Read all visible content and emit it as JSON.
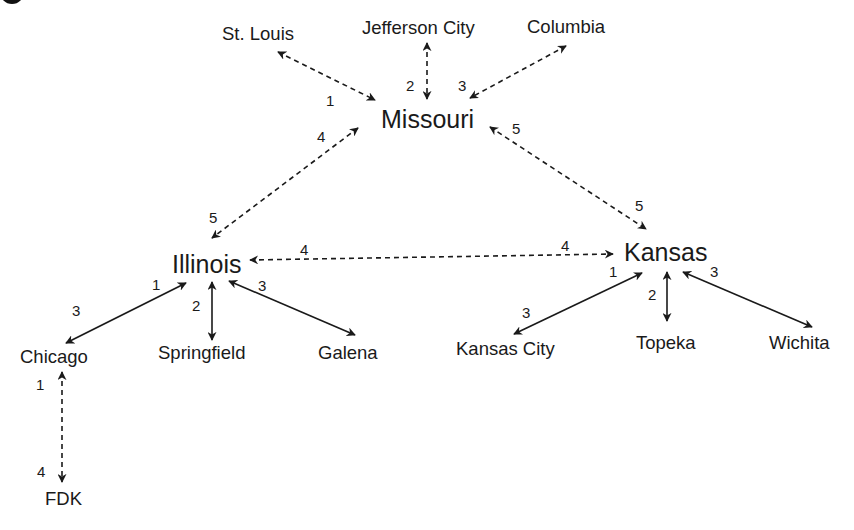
{
  "diagram": {
    "type": "hierarchical-network",
    "states": {
      "missouri": "Missouri",
      "illinois": "Illinois",
      "kansas": "Kansas"
    },
    "cities": {
      "st_louis": "St. Louis",
      "jefferson_city": "Jefferson City",
      "columbia": "Columbia",
      "chicago": "Chicago",
      "springfield": "Springfield",
      "galena": "Galena",
      "kansas_city": "Kansas City",
      "topeka": "Topeka",
      "wichita": "Wichita",
      "fdk": "FDK"
    },
    "edges": [
      {
        "from": "St. Louis",
        "to": "Missouri",
        "style": "dashed",
        "labels": [
          "1"
        ]
      },
      {
        "from": "Jefferson City",
        "to": "Missouri",
        "style": "dashed",
        "labels": [
          "2"
        ]
      },
      {
        "from": "Columbia",
        "to": "Missouri",
        "style": "dashed",
        "labels": [
          "3"
        ]
      },
      {
        "from": "Missouri",
        "to": "Illinois",
        "style": "dashed",
        "labels": [
          "4",
          "5"
        ]
      },
      {
        "from": "Missouri",
        "to": "Kansas",
        "style": "dashed",
        "labels": [
          "5",
          "5"
        ]
      },
      {
        "from": "Illinois",
        "to": "Kansas",
        "style": "dashed",
        "labels": [
          "4",
          "4"
        ]
      },
      {
        "from": "Illinois",
        "to": "Chicago",
        "style": "solid",
        "labels": [
          "1",
          "3"
        ]
      },
      {
        "from": "Illinois",
        "to": "Springfield",
        "style": "solid",
        "labels": [
          "2"
        ]
      },
      {
        "from": "Illinois",
        "to": "Galena",
        "style": "solid",
        "labels": [
          "3"
        ]
      },
      {
        "from": "Kansas",
        "to": "Kansas City",
        "style": "solid",
        "labels": [
          "1",
          "3"
        ]
      },
      {
        "from": "Kansas",
        "to": "Topeka",
        "style": "solid",
        "labels": [
          "2"
        ]
      },
      {
        "from": "Kansas",
        "to": "Wichita",
        "style": "solid",
        "labels": [
          "3"
        ]
      },
      {
        "from": "Chicago",
        "to": "FDK",
        "style": "dashed",
        "labels": [
          "1",
          "4"
        ]
      }
    ],
    "edge_numbers": {
      "stl_1": "1",
      "jc_2": "2",
      "col_3": "3",
      "mo_il_4": "4",
      "mo_il_5": "5",
      "mo_ks_5a": "5",
      "mo_ks_5b": "5",
      "il_ks_4a": "4",
      "il_ks_4b": "4",
      "il_chi_1": "1",
      "il_chi_3": "3",
      "il_spr_2": "2",
      "il_gal_3": "3",
      "ks_kc_1": "1",
      "ks_kc_3": "3",
      "ks_top_2": "2",
      "ks_wic_3": "3",
      "chi_fdk_1": "1",
      "chi_fdk_4": "4"
    },
    "colors": {
      "line": "#1a1a1a",
      "text": "#1a1a1a",
      "background": "#ffffff"
    }
  }
}
